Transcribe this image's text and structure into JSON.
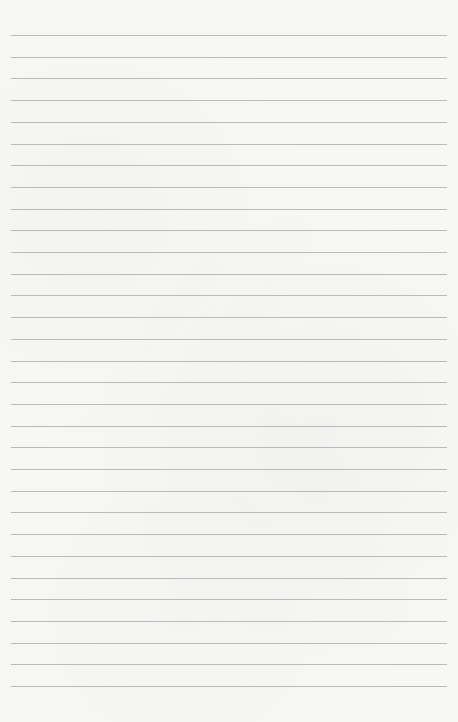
{
  "page": {
    "type": "lined-paper",
    "background_color": "#f7f7f6",
    "line_color": "#b9b9b9",
    "line_count": 31,
    "first_line_y": 35,
    "line_spacing": 21.7,
    "line_left": 11,
    "line_width": 436,
    "text": ""
  }
}
